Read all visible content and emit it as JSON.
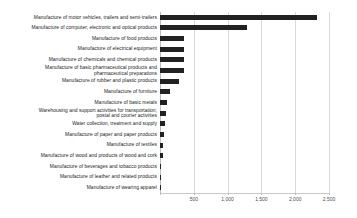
{
  "chart_data": {
    "type": "bar",
    "orientation": "horizontal",
    "title": "",
    "xlabel": "",
    "ylabel": "",
    "xlim": [
      0,
      2500
    ],
    "xticks": [
      0,
      500,
      1000,
      1500,
      2000,
      2500
    ],
    "xtick_labels": [
      "",
      "500",
      "1,000",
      "1,500",
      "2,000",
      "2,500"
    ],
    "grid": true,
    "legend": "none",
    "bar_color": "#222222",
    "grid_color": "#d9d9d9",
    "categories": [
      "Manufacture of motor vehicles, trailers and semi-trailers",
      "Manufacture of computer, electronic and optical products",
      "Manufacture of food products",
      "Manufacture of electrical equipment",
      "Manufacture of chemicals and chemical products",
      "Manufacture of basic pharmaceutical products and\npharmaceutical preparations",
      "Manufacture of rubber and plastic products",
      "Manufacture of furniture",
      "Manufacture of basic metals",
      "Warehousing and support activities for transportation;\npostal and courier activities",
      "Water collection, treatment and supply",
      "Manufacture of paper and paper products",
      "Manufacture of textiles",
      "Manufacture of wood and products of wood and cork",
      "Manufacture of beverages and tobacco products",
      "Manufacture of leather and related products",
      "Manufacture of wearing apparel"
    ],
    "values": [
      2320,
      1290,
      360,
      355,
      350,
      350,
      280,
      150,
      105,
      95,
      75,
      60,
      45,
      40,
      20,
      12,
      5
    ]
  }
}
